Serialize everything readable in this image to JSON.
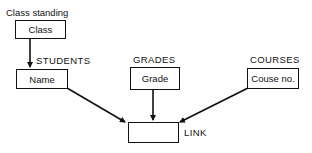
{
  "diagram": {
    "nodes": [
      {
        "id": "class",
        "group_label": "Class standing",
        "field": "Class"
      },
      {
        "id": "students",
        "group_label": "STUDENTS",
        "field": "Name"
      },
      {
        "id": "grades",
        "group_label": "GRADES",
        "field": "Grade"
      },
      {
        "id": "courses",
        "group_label": "COURSES",
        "field": "Couse no."
      },
      {
        "id": "link",
        "group_label": "LINK",
        "field": ""
      }
    ],
    "edges": [
      {
        "from": "class",
        "to": "students"
      },
      {
        "from": "students",
        "to": "link"
      },
      {
        "from": "grades",
        "to": "link"
      },
      {
        "from": "courses",
        "to": "link"
      }
    ],
    "colors": {
      "line": "#111111",
      "background": "#ffffff"
    }
  }
}
